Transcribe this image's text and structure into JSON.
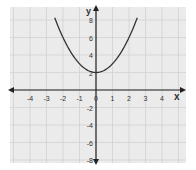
{
  "chart_data": {
    "type": "line",
    "title": "",
    "xlabel": "x",
    "ylabel": "y",
    "xlim": [
      -5,
      5
    ],
    "ylim": [
      -9,
      9
    ],
    "x_ticks": [
      -4,
      -3,
      -2,
      -1,
      0,
      1,
      2,
      3,
      4
    ],
    "y_ticks": [
      -8,
      -6,
      -4,
      -2,
      2,
      4,
      6,
      8
    ],
    "grid": true,
    "legend": null,
    "series": [
      {
        "name": "y = x^2 + 2",
        "function": "x^2 + 2",
        "x": [
          -2.5,
          -2,
          -1.5,
          -1,
          -0.5,
          0,
          0.5,
          1,
          1.5,
          2,
          2.5
        ],
        "y": [
          8.25,
          6,
          4.25,
          3,
          2.25,
          2,
          2.25,
          3,
          4.25,
          6,
          8.25
        ]
      }
    ]
  },
  "colors": {
    "panel": "#ebebeb",
    "grid": "#d2d2d2",
    "axis": "#222222",
    "curve": "#333333",
    "label": "#333333"
  },
  "labels": {
    "x_axis": "x",
    "y_axis": "y",
    "origin": "0"
  }
}
